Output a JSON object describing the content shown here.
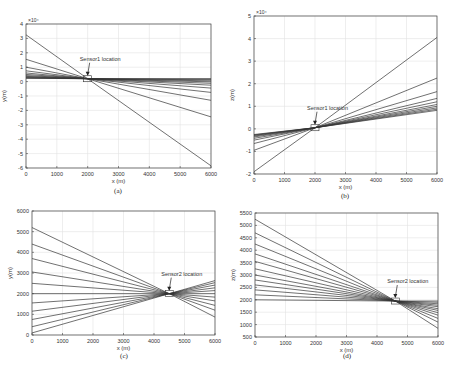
{
  "chart_data": [
    {
      "id": "a",
      "type": "line",
      "caption": "(a)",
      "xlabel": "x (m)",
      "ylabel": "y(m)",
      "exponent": "×10⁴",
      "xlim": [
        0,
        6000
      ],
      "ylim": [
        -6,
        4
      ],
      "xticks": [
        0,
        1000,
        2000,
        3000,
        4000,
        5000,
        6000
      ],
      "yticks": [
        -6,
        -5,
        -4,
        -3,
        -2,
        -1,
        0,
        1,
        2,
        3,
        4
      ],
      "grid": true,
      "annotation": {
        "text": "Sensor1 location",
        "x": 2000,
        "y": 0.2
      },
      "pivot": [
        2000,
        0.2
      ],
      "series_left_y": [
        3.25,
        1.55,
        1.0,
        0.75,
        0.6,
        0.5,
        0.42,
        0.36,
        0.32,
        0.28,
        0.25,
        0.23
      ],
      "series_right_y": [
        -5.85,
        -2.45,
        -1.3,
        -0.75,
        -0.45,
        -0.25,
        -0.12,
        -0.02,
        0.05,
        0.12,
        0.17,
        0.2
      ]
    },
    {
      "id": "b",
      "type": "line",
      "caption": "(b)",
      "xlabel": "x (m)",
      "ylabel": "z(m)",
      "exponent": "×10⁴",
      "xlim": [
        0,
        6000
      ],
      "ylim": [
        -2,
        5
      ],
      "xticks": [
        0,
        1000,
        2000,
        3000,
        4000,
        5000,
        6000
      ],
      "yticks": [
        -2,
        -1,
        0,
        1,
        2,
        3,
        4,
        5
      ],
      "grid": true,
      "annotation": {
        "text": "Sensor1 location",
        "x": 2000,
        "y": 0.05
      },
      "pivot": [
        2000,
        0.05
      ],
      "series_left_y": [
        -1.9,
        -0.95,
        -0.65,
        -0.5,
        -0.42,
        -0.36,
        -0.32,
        -0.29,
        -0.27,
        -0.25
      ],
      "series_right_y": [
        4.05,
        2.25,
        1.65,
        1.35,
        1.2,
        1.08,
        1.0,
        0.93,
        0.87,
        0.82
      ]
    },
    {
      "id": "c",
      "type": "line",
      "caption": "(c)",
      "xlabel": "x (m)",
      "ylabel": "y(m)",
      "xlim": [
        0,
        6000
      ],
      "ylim": [
        0,
        6000
      ],
      "xticks": [
        0,
        1000,
        2000,
        3000,
        4000,
        5000,
        6000
      ],
      "yticks": [
        0,
        1000,
        2000,
        3000,
        4000,
        5000,
        6000
      ],
      "grid": true,
      "annotation": {
        "text": "Sensor2 location",
        "x": 4500,
        "y": 2000
      },
      "pivot": [
        4500,
        2000
      ],
      "series_left_y": [
        5200,
        4400,
        3700,
        3050,
        2500,
        2000,
        1550,
        1150,
        750,
        400,
        100
      ],
      "series_right_y": [
        867,
        1200,
        1433,
        1650,
        1833,
        2000,
        2150,
        2283,
        2417,
        2533,
        2633
      ]
    },
    {
      "id": "d",
      "type": "line",
      "caption": "(d)",
      "xlabel": "x (m)",
      "ylabel": "z(m)",
      "xlim": [
        0,
        6000
      ],
      "ylim": [
        500,
        5500
      ],
      "xticks": [
        0,
        1000,
        2000,
        3000,
        4000,
        5000,
        6000
      ],
      "yticks": [
        500,
        1000,
        1500,
        2000,
        2500,
        3000,
        3500,
        4000,
        4500,
        5000,
        5500
      ],
      "grid": true,
      "annotation": {
        "text": "Sensor2 location",
        "x": 4600,
        "y": 1950
      },
      "pivot": [
        4600,
        1950
      ],
      "series_left_y": [
        5250,
        4700,
        4250,
        3850,
        3550,
        3250,
        3000,
        2800,
        2600,
        2400,
        2200,
        2000
      ],
      "series_right_y": [
        850,
        1100,
        1250,
        1380,
        1480,
        1570,
        1640,
        1720,
        1780,
        1840,
        1900,
        1950
      ]
    }
  ]
}
